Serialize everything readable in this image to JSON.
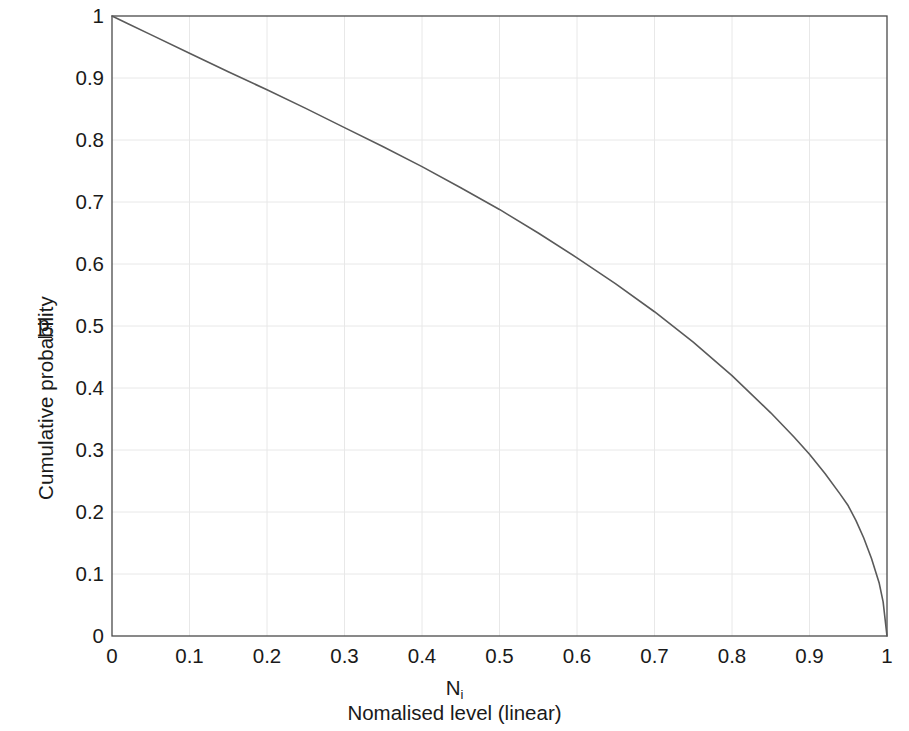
{
  "chart_data": {
    "type": "line",
    "title": "",
    "xlabel": "Nomalised level (linear)",
    "xlabel_symbol": "N",
    "xlabel_symbol_sub": "i",
    "ylabel": "Cumulative probability",
    "ylabel_symbol": "p",
    "ylabel_symbol_sub": "i",
    "xlim": [
      0,
      1
    ],
    "ylim": [
      0,
      1
    ],
    "grid": true,
    "legend": "none",
    "line_color": "#5a5a5a",
    "axis_color": "#4a4a4a",
    "grid_color": "#e8e8e8",
    "background": "#ffffff",
    "xticks": [
      "0",
      "0.1",
      "0.2",
      "0.3",
      "0.4",
      "0.5",
      "0.6",
      "0.7",
      "0.8",
      "0.9",
      "1"
    ],
    "xtick_values": [
      0,
      0.1,
      0.2,
      0.3,
      0.4,
      0.5,
      0.6,
      0.7,
      0.8,
      0.9,
      1
    ],
    "yticks": [
      "0",
      "0.1",
      "0.2",
      "0.3",
      "0.4",
      "0.5",
      "0.6",
      "0.7",
      "0.8",
      "0.9",
      "1"
    ],
    "ytick_values": [
      0,
      0.1,
      0.2,
      0.3,
      0.4,
      0.5,
      0.6,
      0.7,
      0.8,
      0.9,
      1
    ],
    "series": [
      {
        "name": "cumulative probability",
        "x": [
          0.0,
          0.02,
          0.05,
          0.1,
          0.15,
          0.2,
          0.25,
          0.3,
          0.35,
          0.4,
          0.45,
          0.5,
          0.55,
          0.6,
          0.65,
          0.7,
          0.75,
          0.8,
          0.85,
          0.88,
          0.9,
          0.92,
          0.94,
          0.95,
          0.96,
          0.97,
          0.98,
          0.99,
          0.995,
          1.0
        ],
        "y": [
          1.0,
          0.988,
          0.97,
          0.94,
          0.91,
          0.881,
          0.851,
          0.82,
          0.789,
          0.757,
          0.723,
          0.688,
          0.65,
          0.61,
          0.568,
          0.523,
          0.474,
          0.42,
          0.36,
          0.321,
          0.293,
          0.262,
          0.228,
          0.21,
          0.186,
          0.158,
          0.125,
          0.085,
          0.055,
          0.0
        ]
      }
    ]
  },
  "plot_geometry": {
    "left_px": 112,
    "right_px": 887,
    "top_px": 16,
    "bottom_px": 636
  }
}
